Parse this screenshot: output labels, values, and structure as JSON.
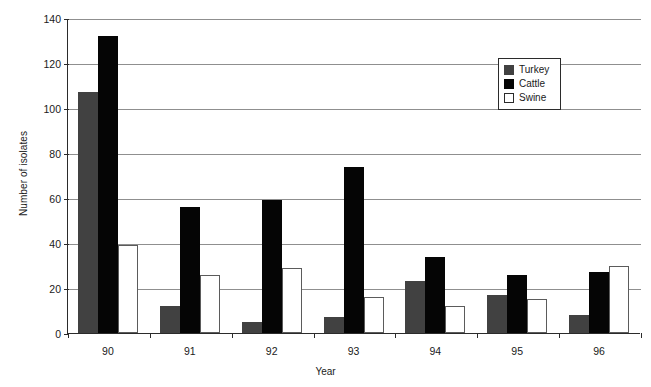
{
  "chart_data": {
    "type": "bar",
    "title": "",
    "xlabel": "Year",
    "ylabel": "Number of isolates",
    "categories": [
      "90",
      "91",
      "92",
      "93",
      "94",
      "95",
      "96"
    ],
    "series": [
      {
        "name": "Turkey",
        "color": "#414141",
        "values": [
          107,
          12,
          5,
          7,
          23,
          17,
          8
        ]
      },
      {
        "name": "Cattle",
        "color": "#050505",
        "values": [
          132,
          56,
          59,
          74,
          34,
          26,
          27
        ]
      },
      {
        "name": "Swine",
        "color": "#ffffff",
        "values": [
          39,
          26,
          29,
          16,
          12,
          15,
          30
        ]
      }
    ],
    "ylim": [
      0,
      140
    ],
    "yticks": [
      0,
      20,
      40,
      60,
      80,
      100,
      120,
      140
    ],
    "ytick_labels": [
      "0",
      "20",
      "40",
      "60",
      "80",
      "100",
      "120",
      "140"
    ],
    "grid": true,
    "legend_position": "upper-right",
    "legend_entries": [
      "Turkey",
      "Cattle",
      "Swine"
    ]
  }
}
